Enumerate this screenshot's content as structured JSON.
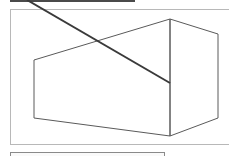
{
  "diagram": {
    "type": "3d-box-perspective",
    "colors": {
      "box_stroke": "#5a5a5a",
      "diagonal_stroke": "#3a3a3a",
      "frame_border": "#b8b8b8",
      "top_bar": "#4a4a4a"
    },
    "box": {
      "front_face": [
        [
          34,
          60
        ],
        [
          170,
          19
        ],
        [
          170,
          136
        ],
        [
          34,
          118
        ]
      ],
      "right_face": [
        [
          170,
          19
        ],
        [
          218,
          34
        ],
        [
          218,
          118
        ],
        [
          170,
          136
        ]
      ]
    },
    "diagonal_line": {
      "from": [
        27,
        0
      ],
      "to": [
        170,
        83
      ]
    }
  }
}
